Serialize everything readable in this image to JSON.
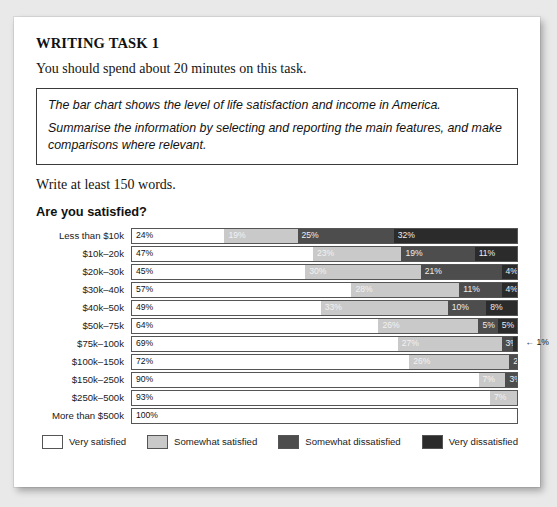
{
  "task": {
    "title": "WRITING TASK 1",
    "instruction": "You should spend about 20 minutes on this task.",
    "prompt_lines": [
      "The bar chart shows the level of life satisfaction and income in America.",
      "Summarise the information by selecting and reporting the main features, and make comparisons where relevant."
    ],
    "words_note": "Write at least 150 words."
  },
  "chart_data": {
    "type": "bar",
    "title": "Are you satisfied?",
    "xlabel": "",
    "ylabel": "",
    "xlim": [
      0,
      100
    ],
    "grid": false,
    "legend_position": "bottom",
    "stacked": true,
    "orientation": "horizontal",
    "categories": [
      "Less than $10k",
      "$10k–20k",
      "$20k–30k",
      "$30k–40k",
      "$40k–50k",
      "$50k–75k",
      "$75k–100k",
      "$100k–150k",
      "$150k–250k",
      "$250k–500k",
      "More than $500k"
    ],
    "series": [
      {
        "name": "Very satisfied",
        "color": "#ffffff",
        "values": [
          24,
          47,
          45,
          57,
          49,
          64,
          69,
          72,
          90,
          93,
          100
        ]
      },
      {
        "name": "Somewhat satisfied",
        "color": "#c9c9c9",
        "values": [
          19,
          23,
          30,
          28,
          33,
          26,
          27,
          26,
          7,
          7,
          0
        ]
      },
      {
        "name": "Somewhat dissatisfied",
        "color": "#4d4d4d",
        "values": [
          25,
          19,
          21,
          11,
          10,
          5,
          3,
          2,
          3,
          0,
          0
        ]
      },
      {
        "name": "Very dissatisfied",
        "color": "#2b2b2b",
        "values": [
          32,
          11,
          4,
          4,
          8,
          5,
          1,
          0,
          0,
          0,
          0
        ]
      }
    ],
    "rows": [
      {
        "label": "Less than $10k",
        "segments": [
          {
            "series": 0,
            "value": 24,
            "label": "24%"
          },
          {
            "series": 1,
            "value": 19,
            "label": "19%"
          },
          {
            "series": 2,
            "value": 25,
            "label": "25%"
          },
          {
            "series": 3,
            "value": 32,
            "label": "32%"
          }
        ],
        "callout": ""
      },
      {
        "label": "$10k–20k",
        "segments": [
          {
            "series": 0,
            "value": 47,
            "label": "47%"
          },
          {
            "series": 1,
            "value": 23,
            "label": "23%"
          },
          {
            "series": 2,
            "value": 19,
            "label": "19%"
          },
          {
            "series": 3,
            "value": 11,
            "label": "11%"
          }
        ],
        "callout": ""
      },
      {
        "label": "$20k–30k",
        "segments": [
          {
            "series": 0,
            "value": 45,
            "label": "45%"
          },
          {
            "series": 1,
            "value": 30,
            "label": "30%"
          },
          {
            "series": 2,
            "value": 21,
            "label": "21%"
          },
          {
            "series": 3,
            "value": 4,
            "label": "4%"
          }
        ],
        "callout": ""
      },
      {
        "label": "$30k–40k",
        "segments": [
          {
            "series": 0,
            "value": 57,
            "label": "57%"
          },
          {
            "series": 1,
            "value": 28,
            "label": "28%"
          },
          {
            "series": 2,
            "value": 11,
            "label": "11%"
          },
          {
            "series": 3,
            "value": 4,
            "label": "4%"
          }
        ],
        "callout": ""
      },
      {
        "label": "$40k–50k",
        "segments": [
          {
            "series": 0,
            "value": 49,
            "label": "49%"
          },
          {
            "series": 1,
            "value": 33,
            "label": "33%"
          },
          {
            "series": 2,
            "value": 10,
            "label": "10%"
          },
          {
            "series": 3,
            "value": 8,
            "label": "8%"
          }
        ],
        "callout": ""
      },
      {
        "label": "$50k–75k",
        "segments": [
          {
            "series": 0,
            "value": 64,
            "label": "64%"
          },
          {
            "series": 1,
            "value": 26,
            "label": "26%"
          },
          {
            "series": 2,
            "value": 5,
            "label": "5%"
          },
          {
            "series": 3,
            "value": 5,
            "label": "5%"
          }
        ],
        "callout": ""
      },
      {
        "label": "$75k–100k",
        "segments": [
          {
            "series": 0,
            "value": 69,
            "label": "69%"
          },
          {
            "series": 1,
            "value": 27,
            "label": "27%"
          },
          {
            "series": 2,
            "value": 3,
            "label": "3%"
          },
          {
            "series": 3,
            "value": 1,
            "label": ""
          }
        ],
        "callout": "← 1%"
      },
      {
        "label": "$100k–150k",
        "segments": [
          {
            "series": 0,
            "value": 72,
            "label": "72%"
          },
          {
            "series": 1,
            "value": 26,
            "label": "26%"
          },
          {
            "series": 2,
            "value": 2,
            "label": "2%"
          }
        ],
        "callout": ""
      },
      {
        "label": "$150k–250k",
        "segments": [
          {
            "series": 0,
            "value": 90,
            "label": "90%"
          },
          {
            "series": 1,
            "value": 7,
            "label": "7%"
          },
          {
            "series": 2,
            "value": 3,
            "label": "3%"
          }
        ],
        "callout": ""
      },
      {
        "label": "$250k–500k",
        "segments": [
          {
            "series": 0,
            "value": 93,
            "label": "93%"
          },
          {
            "series": 1,
            "value": 7,
            "label": "7%"
          }
        ],
        "callout": ""
      },
      {
        "label": "More than $500k",
        "segments": [
          {
            "series": 0,
            "value": 100,
            "label": "100%"
          }
        ],
        "callout": ""
      }
    ],
    "legend": [
      {
        "label": "Very satisfied",
        "color": "#ffffff"
      },
      {
        "label": "Somewhat satisfied",
        "color": "#c9c9c9"
      },
      {
        "label": "Somewhat dissatisfied",
        "color": "#4d4d4d"
      },
      {
        "label": "Very dissatisfied",
        "color": "#2b2b2b"
      }
    ]
  }
}
